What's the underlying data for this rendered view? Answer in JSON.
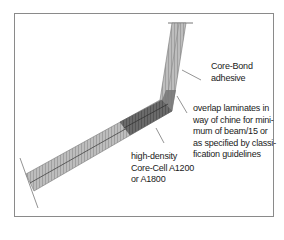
{
  "diagram": {
    "type": "chine laminate cross-section",
    "labels": {
      "core_bond": [
        "Core-Bond",
        "adhesive"
      ],
      "overlap": [
        "overlap laminates in",
        "way of chine for mini-",
        "mum of beam/15 or",
        "as specified by classi-",
        "fication guidelines"
      ],
      "high_density": [
        "high-density",
        "Core-Cell A1200",
        "or A1800"
      ]
    },
    "colors": {
      "frame": "#8a8a8a",
      "laminate_light": "#b5b5b5",
      "laminate_dark": "#5a5a5a",
      "leader": "#666666",
      "text": "#1a1a1a"
    }
  }
}
